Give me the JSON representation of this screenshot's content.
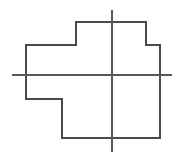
{
  "figure": {
    "canvas": {
      "width": 183,
      "height": 160,
      "background": "#ffffff"
    },
    "stroke_color": "#4a4a4a",
    "axis_color": "#585858",
    "stroke_width": 1.15
  },
  "chart_data": {
    "type": "scatter",
    "subtitle": "",
    "xlabel": "",
    "ylabel": "",
    "xlim": [
      0,
      183
    ],
    "ylim": [
      0,
      160
    ],
    "grid": false,
    "legend": null,
    "tick_labels": {
      "x": [],
      "y": []
    },
    "annotations": [],
    "series": [
      {
        "name": "polygon-outline",
        "type": "closed-polyline",
        "closed": true,
        "stroke": "#4a4a4a",
        "points": [
          [
            26,
            45
          ],
          [
            76,
            45
          ],
          [
            76,
            22
          ],
          [
            146,
            22
          ],
          [
            146,
            45
          ],
          [
            160,
            45
          ],
          [
            160,
            138
          ],
          [
            62,
            138
          ],
          [
            62,
            99
          ],
          [
            26,
            99
          ]
        ]
      },
      {
        "name": "vertical-axis",
        "type": "line",
        "closed": false,
        "stroke": "#585858",
        "points": [
          [
            112,
            10
          ],
          [
            112,
            152
          ]
        ]
      },
      {
        "name": "horizontal-axis",
        "type": "line",
        "closed": false,
        "stroke": "#585858",
        "points": [
          [
            12,
            75
          ],
          [
            172,
            75
          ]
        ]
      }
    ]
  }
}
